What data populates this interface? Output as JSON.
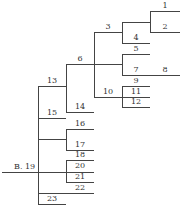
{
  "diagram": {
    "type": "dendrogram",
    "root_label": "B. 19",
    "line_color": "#444444",
    "nodes": [
      {
        "id": "1",
        "x": 165,
        "y": 2
      },
      {
        "id": "2",
        "x": 165,
        "y": 23
      },
      {
        "id": "3",
        "x": 108,
        "y": 23
      },
      {
        "id": "4",
        "x": 136,
        "y": 34
      },
      {
        "id": "5",
        "x": 136,
        "y": 45
      },
      {
        "id": "6",
        "x": 80,
        "y": 55
      },
      {
        "id": "7",
        "x": 136,
        "y": 66
      },
      {
        "id": "8",
        "x": 165,
        "y": 66
      },
      {
        "id": "9",
        "x": 136,
        "y": 77
      },
      {
        "id": "10",
        "x": 108,
        "y": 88
      },
      {
        "id": "11",
        "x": 136,
        "y": 88
      },
      {
        "id": "12",
        "x": 136,
        "y": 98
      },
      {
        "id": "13",
        "x": 52,
        "y": 77
      },
      {
        "id": "14",
        "x": 80,
        "y": 103
      },
      {
        "id": "15",
        "x": 52,
        "y": 109
      },
      {
        "id": "16",
        "x": 80,
        "y": 120
      },
      {
        "id": "17",
        "x": 80,
        "y": 141
      },
      {
        "id": "18",
        "x": 80,
        "y": 151
      },
      {
        "id": "20",
        "x": 80,
        "y": 162
      },
      {
        "id": "21",
        "x": 80,
        "y": 173
      },
      {
        "id": "22",
        "x": 80,
        "y": 184
      },
      {
        "id": "23",
        "x": 52,
        "y": 195
      }
    ],
    "root": {
      "label": "B. 19",
      "x": 14,
      "y": 163
    }
  }
}
